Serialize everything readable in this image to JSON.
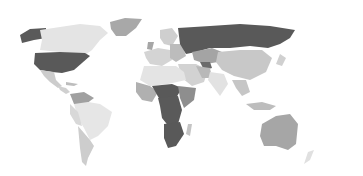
{
  "map": {
    "type": "world-choropleth",
    "palette": {
      "high": "#5a5a5a",
      "mid_high": "#8c8c8c",
      "mid": "#b4b4b4",
      "low": "#d2d2d2",
      "lowest": "#e8e8e8",
      "background": "#ffffff"
    },
    "regions": [
      {
        "name": "Alaska",
        "shade": "high"
      },
      {
        "name": "Canada",
        "shade": "lowest"
      },
      {
        "name": "Greenland",
        "shade": "mid"
      },
      {
        "name": "United States",
        "shade": "high"
      },
      {
        "name": "Mexico",
        "shade": "low"
      },
      {
        "name": "Central America",
        "shade": "low"
      },
      {
        "name": "Colombia / Venezuela",
        "shade": "mid"
      },
      {
        "name": "Brazil",
        "shade": "lowest"
      },
      {
        "name": "Argentina / Chile",
        "shade": "low"
      },
      {
        "name": "Western Europe",
        "shade": "low"
      },
      {
        "name": "Scandinavia",
        "shade": "low"
      },
      {
        "name": "Russia",
        "shade": "high"
      },
      {
        "name": "Kazakhstan",
        "shade": "mid"
      },
      {
        "name": "China",
        "shade": "low"
      },
      {
        "name": "India",
        "shade": "lowest"
      },
      {
        "name": "Middle East",
        "shade": "low"
      },
      {
        "name": "North Africa",
        "shade": "lowest"
      },
      {
        "name": "West Africa",
        "shade": "mid"
      },
      {
        "name": "Central Africa",
        "shade": "high"
      },
      {
        "name": "East Africa",
        "shade": "mid_high"
      },
      {
        "name": "Southern Africa",
        "shade": "high"
      },
      {
        "name": "Southeast Asia",
        "shade": "low"
      },
      {
        "name": "Australia",
        "shade": "mid"
      },
      {
        "name": "New Zealand",
        "shade": "lowest"
      }
    ]
  }
}
